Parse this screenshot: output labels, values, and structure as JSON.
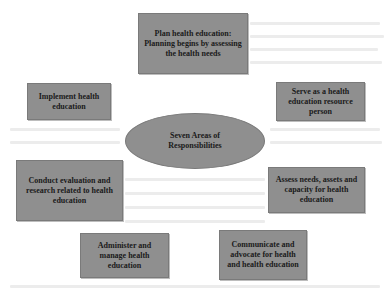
{
  "diagram": {
    "center": {
      "label": "Seven Areas of Responsibilities"
    },
    "nodes": [
      {
        "id": "plan",
        "label": "Plan health education: Planning begins by assessing the health needs"
      },
      {
        "id": "implement",
        "label": "Implement health education"
      },
      {
        "id": "serve",
        "label": "Serve as a health education resource person"
      },
      {
        "id": "conduct",
        "label": "Conduct evaluation and research related to health education"
      },
      {
        "id": "assess",
        "label": "Assess needs, assets and capacity for health education"
      },
      {
        "id": "administer",
        "label": "Administer and manage health education"
      },
      {
        "id": "communicate",
        "label": "Communicate and advocate for health and health education"
      }
    ],
    "colors": {
      "box_fill": "#8f8f8f",
      "text": "#1a1a1a",
      "background": "#ffffff"
    }
  }
}
